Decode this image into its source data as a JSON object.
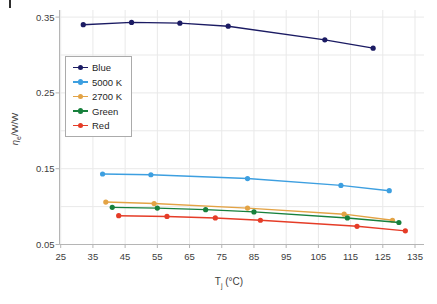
{
  "chart_data": {
    "type": "line",
    "title": "",
    "xlabel": {
      "base": "T",
      "subscript": "j",
      "suffix": " (°C)"
    },
    "ylabel": {
      "symbol": "η",
      "subscript": "e",
      "suffix": "/W/W"
    },
    "xlim": [
      25,
      135
    ],
    "ylim": [
      0.05,
      0.36
    ],
    "x_ticks": [
      25,
      35,
      45,
      55,
      65,
      75,
      85,
      95,
      105,
      115,
      125,
      135
    ],
    "y_ticks": [
      0.05,
      0.15,
      0.25,
      0.35
    ],
    "y_grid_step": 0.05,
    "grid": true,
    "legend_position": "upper-left-inside",
    "axis_color": "#b5b5b5",
    "grid_color": "#e9e9e9",
    "series": [
      {
        "name": "Blue",
        "color": "#1b1b63",
        "x": [
          32,
          47,
          62,
          77,
          107,
          122
        ],
        "y": [
          0.34,
          0.343,
          0.342,
          0.338,
          0.32,
          0.309
        ]
      },
      {
        "name": "5000 K",
        "color": "#3d9fe0",
        "x": [
          38,
          53,
          83,
          112,
          127
        ],
        "y": [
          0.143,
          0.142,
          0.137,
          0.128,
          0.121
        ]
      },
      {
        "name": "2700 K",
        "color": "#e3a345",
        "x": [
          39,
          54,
          83,
          113,
          128
        ],
        "y": [
          0.106,
          0.104,
          0.098,
          0.09,
          0.082
        ]
      },
      {
        "name": "Green",
        "color": "#17803c",
        "x": [
          41,
          55,
          70,
          85,
          114,
          130
        ],
        "y": [
          0.099,
          0.098,
          0.096,
          0.093,
          0.085,
          0.079
        ]
      },
      {
        "name": "Red",
        "color": "#e53c27",
        "x": [
          43,
          58,
          73,
          87,
          117,
          132
        ],
        "y": [
          0.088,
          0.087,
          0.085,
          0.082,
          0.074,
          0.068
        ]
      }
    ]
  }
}
